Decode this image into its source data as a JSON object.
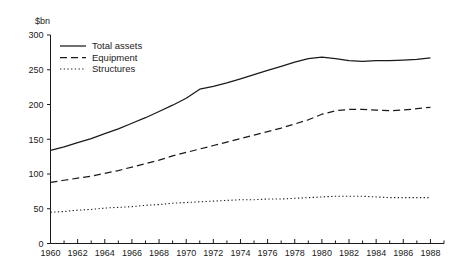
{
  "chart_data": {
    "type": "line",
    "title": "",
    "subtitle": "",
    "xlabel": "",
    "ylabel": "$bn",
    "ylim": [
      0,
      300
    ],
    "xlim": [
      1960,
      1989
    ],
    "grid": false,
    "legend_position": "top-left",
    "y_ticks": [
      0,
      50,
      100,
      150,
      200,
      250,
      300
    ],
    "y_tick_labels": [
      "0",
      "50",
      "100",
      "150",
      "200",
      "250",
      "300"
    ],
    "x_ticks": [
      1960,
      1962,
      1964,
      1966,
      1968,
      1970,
      1972,
      1974,
      1976,
      1978,
      1980,
      1982,
      1984,
      1986,
      1988
    ],
    "x_tick_labels": [
      "1960",
      "1962",
      "1964",
      "1966",
      "1968",
      "1970",
      "1972",
      "1974",
      "1976",
      "1978",
      "1980",
      "1982",
      "1984",
      "1986",
      "1988"
    ],
    "x_minor_ticks": [
      1961,
      1963,
      1965,
      1967,
      1969,
      1971,
      1973,
      1975,
      1977,
      1979,
      1981,
      1983,
      1985,
      1987,
      1989
    ],
    "x": [
      1960,
      1961,
      1962,
      1963,
      1964,
      1965,
      1966,
      1967,
      1968,
      1969,
      1970,
      1971,
      1972,
      1973,
      1974,
      1975,
      1976,
      1977,
      1978,
      1979,
      1980,
      1981,
      1982,
      1983,
      1984,
      1985,
      1986,
      1987,
      1988
    ],
    "series": [
      {
        "name": "Total assets",
        "style": "solid",
        "values": [
          134,
          139,
          145,
          151,
          158,
          165,
          173,
          181,
          190,
          199,
          209,
          222,
          226,
          231,
          237,
          243,
          249,
          255,
          261,
          266,
          268,
          266,
          263,
          262,
          263,
          263,
          264,
          265,
          267
        ]
      },
      {
        "name": "Equipment",
        "style": "dashed",
        "values": [
          88,
          91,
          94,
          97,
          101,
          105,
          110,
          115,
          120,
          126,
          131,
          136,
          141,
          146,
          151,
          156,
          161,
          166,
          172,
          178,
          186,
          191,
          193,
          193,
          192,
          191,
          192,
          194,
          196
        ]
      },
      {
        "name": "Structures",
        "style": "dotted",
        "values": [
          45,
          46,
          48,
          49,
          51,
          52,
          53,
          55,
          56,
          58,
          59,
          60,
          61,
          62,
          63,
          63,
          64,
          64,
          65,
          66,
          67,
          68,
          68,
          68,
          67,
          66,
          66,
          66,
          66
        ]
      }
    ],
    "legend": [
      "Total assets",
      "Equipment",
      "Structures"
    ],
    "colors": {
      "line": "#1a1a1a",
      "axis": "#1a1a1a",
      "background": "#ffffff"
    }
  }
}
